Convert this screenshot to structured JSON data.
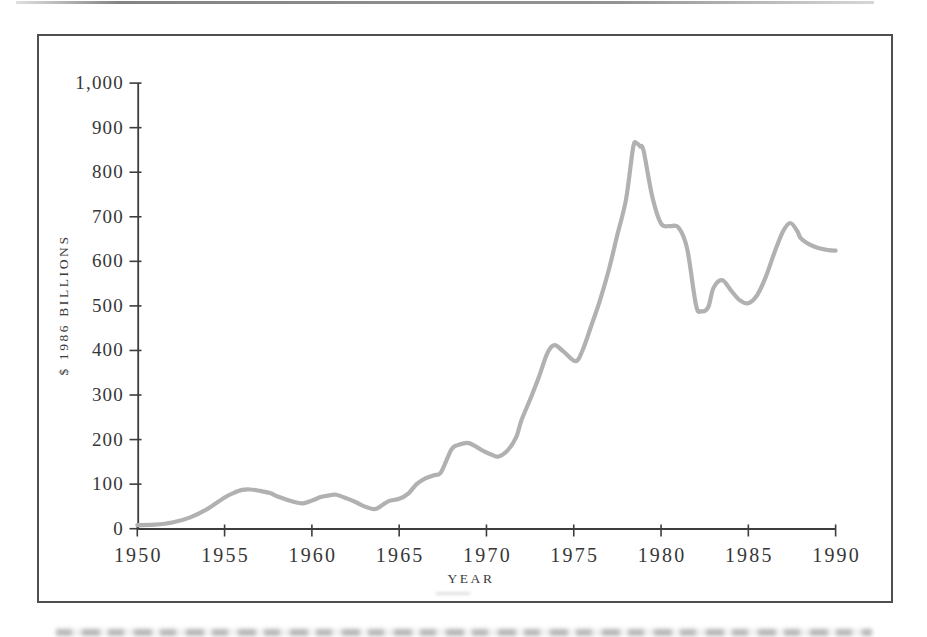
{
  "colors": {
    "line": "#b1b1b1",
    "axis": "#3d3d3d",
    "tick_text": "#373737",
    "frame": "#4f4f4f",
    "background": "#ffffff"
  },
  "chart_data": {
    "type": "line",
    "title": "",
    "xlabel": "YEAR",
    "ylabel": "$ 1986 BILLIONS",
    "xlim": [
      1950,
      1990
    ],
    "ylim": [
      0,
      1000
    ],
    "grid": false,
    "legend": false,
    "x_ticks": [
      1950,
      1955,
      1960,
      1965,
      1970,
      1975,
      1980,
      1985,
      1990
    ],
    "x_tick_labels": [
      "1950",
      "1955",
      "1960",
      "1965",
      "1970",
      "1975",
      "1980",
      "1985",
      "1990"
    ],
    "y_ticks": [
      0,
      100,
      200,
      300,
      400,
      500,
      600,
      700,
      800,
      900,
      1000
    ],
    "y_tick_labels": [
      "0",
      "100",
      "200",
      "300",
      "400",
      "500",
      "600",
      "700",
      "800",
      "900",
      "1,000"
    ],
    "series": [
      {
        "name": "$ 1986 billions",
        "points": [
          [
            1950,
            8
          ],
          [
            1951,
            9
          ],
          [
            1952,
            14
          ],
          [
            1953,
            25
          ],
          [
            1954,
            44
          ],
          [
            1955,
            70
          ],
          [
            1955.5,
            80
          ],
          [
            1956,
            87
          ],
          [
            1956.5,
            88
          ],
          [
            1957,
            85
          ],
          [
            1957.6,
            80
          ],
          [
            1958,
            73
          ],
          [
            1959,
            60
          ],
          [
            1959.5,
            57
          ],
          [
            1960,
            63
          ],
          [
            1960.5,
            71
          ],
          [
            1961,
            75
          ],
          [
            1961.4,
            76
          ],
          [
            1962,
            68
          ],
          [
            1962.5,
            60
          ],
          [
            1963,
            50
          ],
          [
            1963.6,
            44
          ],
          [
            1964,
            52
          ],
          [
            1964.4,
            62
          ],
          [
            1965,
            67
          ],
          [
            1965.5,
            78
          ],
          [
            1966,
            100
          ],
          [
            1966.5,
            113
          ],
          [
            1967,
            120
          ],
          [
            1967.4,
            127
          ],
          [
            1968,
            178
          ],
          [
            1968.4,
            188
          ],
          [
            1969,
            192
          ],
          [
            1969.7,
            177
          ],
          [
            1970.3,
            166
          ],
          [
            1970.7,
            162
          ],
          [
            1971.2,
            175
          ],
          [
            1971.7,
            205
          ],
          [
            1972,
            243
          ],
          [
            1972.5,
            290
          ],
          [
            1973,
            340
          ],
          [
            1973.5,
            395
          ],
          [
            1973.9,
            412
          ],
          [
            1974.4,
            398
          ],
          [
            1975.1,
            376
          ],
          [
            1975.5,
            400
          ],
          [
            1976,
            455
          ],
          [
            1976.5,
            512
          ],
          [
            1977,
            580
          ],
          [
            1977.5,
            660
          ],
          [
            1978,
            740
          ],
          [
            1978.4,
            855
          ],
          [
            1978.6,
            865
          ],
          [
            1978.8,
            858
          ],
          [
            1979,
            848
          ],
          [
            1979.5,
            745
          ],
          [
            1980,
            685
          ],
          [
            1980.5,
            679
          ],
          [
            1981,
            676
          ],
          [
            1981.5,
            628
          ],
          [
            1982,
            502
          ],
          [
            1982.3,
            488
          ],
          [
            1982.7,
            497
          ],
          [
            1983,
            540
          ],
          [
            1983.5,
            558
          ],
          [
            1984,
            535
          ],
          [
            1984.5,
            513
          ],
          [
            1985,
            506
          ],
          [
            1985.5,
            524
          ],
          [
            1986,
            565
          ],
          [
            1986.5,
            620
          ],
          [
            1987,
            668
          ],
          [
            1987.4,
            686
          ],
          [
            1987.8,
            668
          ],
          [
            1988,
            652
          ],
          [
            1988.5,
            638
          ],
          [
            1989,
            630
          ],
          [
            1989.5,
            626
          ],
          [
            1990,
            624
          ]
        ]
      }
    ]
  }
}
